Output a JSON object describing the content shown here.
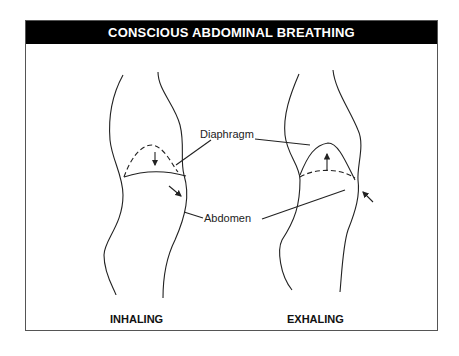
{
  "title": "CONSCIOUS ABDOMINAL BREATHING",
  "labels": {
    "diaphragm": "Diaphragm",
    "abdomen": "Abdomen"
  },
  "captions": {
    "left": "INHALING",
    "right": "EXHALING"
  },
  "colors": {
    "title_bg": "#000000",
    "title_text": "#ffffff",
    "line": "#222222"
  }
}
